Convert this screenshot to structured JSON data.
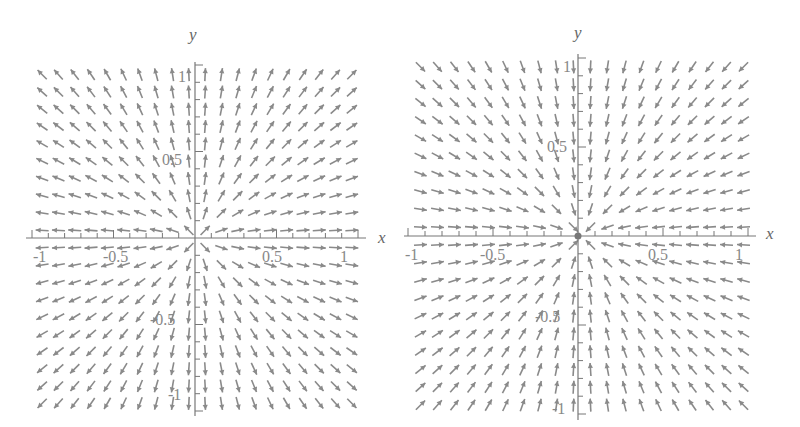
{
  "figure": {
    "panels": [
      {
        "id": "left",
        "title": "",
        "xlabel": "x",
        "ylabel": "y",
        "field": "source",
        "field_description": "F(x,y) = (x, y) normalized — arrows point away from origin",
        "x_ticks": [
          "-1",
          "-0.5",
          "0.5",
          "1"
        ],
        "y_ticks": [
          "1",
          "0.5",
          "-0.5",
          "-1"
        ],
        "arrow_color": "#8a8a8a"
      },
      {
        "id": "right",
        "title": "",
        "xlabel": "x",
        "ylabel": "y",
        "field": "sink",
        "field_description": "F(x,y) = (-x, -y) normalized — arrows point toward origin",
        "x_ticks": [
          "-1",
          "-0.5",
          "0.5",
          "1"
        ],
        "y_ticks": [
          "1",
          "0.5",
          "-0.5",
          "-1"
        ],
        "arrow_color": "#8a8a8a"
      }
    ]
  },
  "chart_data": [
    {
      "type": "vector_field",
      "title": "",
      "xlabel": "x",
      "ylabel": "y",
      "xlim": [
        -1,
        1
      ],
      "ylim": [
        -1,
        1
      ],
      "x_ticks": [
        -1,
        -0.5,
        0.5,
        1
      ],
      "y_ticks": [
        -1,
        -0.5,
        0.5,
        1
      ],
      "field": {
        "u": "x",
        "v": "y"
      },
      "grid_density": 20,
      "grid": false
    },
    {
      "type": "vector_field",
      "title": "",
      "xlabel": "x",
      "ylabel": "y",
      "xlim": [
        -1,
        1
      ],
      "ylim": [
        -1,
        1
      ],
      "x_ticks": [
        -1,
        -0.5,
        0.5,
        1
      ],
      "y_ticks": [
        -1,
        -0.5,
        0.5,
        1
      ],
      "field": {
        "u": "-x",
        "v": "-y"
      },
      "grid_density": 20,
      "grid": false
    }
  ]
}
